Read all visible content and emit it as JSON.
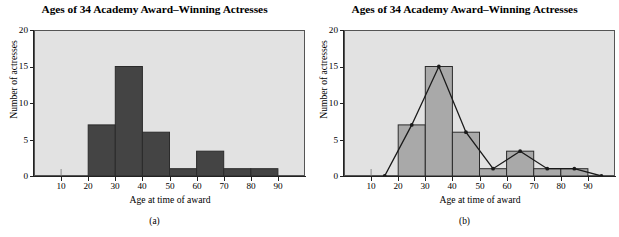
{
  "figure": {
    "panels": [
      {
        "caption": "(a)",
        "title": "Ages of 34 Academy Award–Winning Actresses",
        "xlabel": "Age at time of award",
        "ylabel": "Number of actresses"
      },
      {
        "caption": "(b)",
        "title": "Ages of 34 Academy Award–Winning Actresses",
        "xlabel": "Age at time of award",
        "ylabel": "Number of actresses"
      }
    ],
    "colors": {
      "plot_background": "#e2e2e2",
      "bar_fill_a": "#444444",
      "bar_fill_b": "#a9a9a9",
      "bar_stroke": "#2b2b2b",
      "axis": "#222222",
      "polygon_line": "#1a1a1a"
    }
  },
  "chart_data": [
    {
      "type": "bar",
      "title": "Ages of 34 Academy Award–Winning Actresses",
      "xlabel": "Age at time of award",
      "ylabel": "Number of actresses",
      "xlim": [
        0,
        100
      ],
      "ylim": [
        0,
        20
      ],
      "xticks": [
        10,
        20,
        30,
        40,
        50,
        60,
        70,
        80,
        90
      ],
      "yticks": [
        0,
        5,
        10,
        15,
        20
      ],
      "grid": false,
      "bin_edges": [
        20,
        30,
        40,
        50,
        60,
        70,
        80,
        90
      ],
      "categories": [
        "20-30",
        "30-40",
        "40-50",
        "50-60",
        "60-70",
        "70-80",
        "80-90"
      ],
      "values": [
        7,
        15,
        6,
        1,
        3.4,
        1,
        1
      ],
      "bar_style": "dark-filled"
    },
    {
      "type": "bar",
      "title": "Ages of 34 Academy Award–Winning Actresses",
      "xlabel": "Age at time of award",
      "ylabel": "Number of actresses",
      "xlim": [
        0,
        100
      ],
      "ylim": [
        0,
        20
      ],
      "xticks": [
        10,
        20,
        30,
        40,
        50,
        60,
        70,
        80,
        90
      ],
      "yticks": [
        0,
        5,
        10,
        15,
        20
      ],
      "grid": false,
      "bin_edges": [
        20,
        30,
        40,
        50,
        60,
        70,
        80,
        90
      ],
      "categories": [
        "20-30",
        "30-40",
        "40-50",
        "50-60",
        "60-70",
        "70-80",
        "80-90"
      ],
      "values": [
        7,
        15,
        6,
        1,
        3.4,
        1,
        1
      ],
      "bar_style": "light-filled",
      "overlay": {
        "type": "line",
        "name": "frequency polygon",
        "x": [
          15,
          25,
          35,
          45,
          55,
          65,
          75,
          85,
          95
        ],
        "y": [
          0,
          7,
          15,
          6,
          1,
          3.4,
          1,
          1,
          0
        ],
        "markers": true
      }
    }
  ]
}
